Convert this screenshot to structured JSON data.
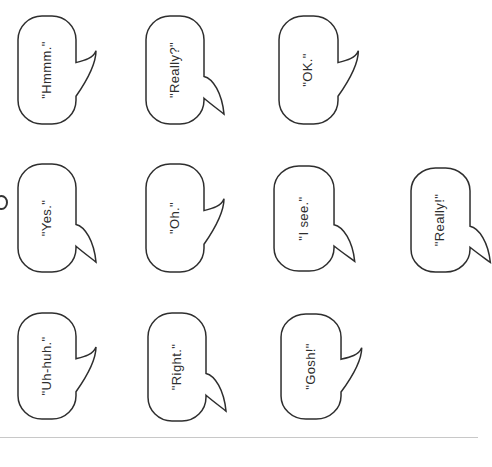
{
  "canvas": {
    "width": 478,
    "height": 467,
    "background": "#ffffff"
  },
  "style": {
    "stroke_color": "#2e2e2e",
    "text_color": "#2e2e2e",
    "bottom_line_color": "#c8c8c8"
  },
  "bubbles": [
    {
      "label": "\"Hmmm.\"",
      "x": 17,
      "y": 15,
      "w": 58,
      "h": 110,
      "tail": "up"
    },
    {
      "label": "\"Really?\"",
      "x": 145,
      "y": 15,
      "w": 58,
      "h": 110,
      "tail": "down"
    },
    {
      "label": "\"OK.\"",
      "x": 278,
      "y": 15,
      "w": 59,
      "h": 110,
      "tail": "up"
    },
    {
      "label": "\"Yes.\"",
      "x": 17,
      "y": 163,
      "w": 58,
      "h": 110,
      "tail": "down"
    },
    {
      "label": "\"Oh.\"",
      "x": 145,
      "y": 163,
      "w": 58,
      "h": 110,
      "tail": "up"
    },
    {
      "label": "\"I see.\"",
      "x": 273,
      "y": 165,
      "w": 60,
      "h": 107,
      "tail": "down"
    },
    {
      "label": "\"Really!\"",
      "x": 410,
      "y": 167,
      "w": 59,
      "h": 106,
      "tail": "down"
    },
    {
      "label": "\"Uh-huh.\"",
      "x": 17,
      "y": 312,
      "w": 58,
      "h": 108,
      "tail": "up"
    },
    {
      "label": "\"Right.\"",
      "x": 147,
      "y": 312,
      "w": 58,
      "h": 110,
      "tail": "down"
    },
    {
      "label": "\"Gosh!\"",
      "x": 280,
      "y": 313,
      "w": 60,
      "h": 107,
      "tail": "up"
    }
  ],
  "decor": {
    "left_edge_partial_glyph": "cut-off letter at page edge",
    "bottom_line_y": 437
  }
}
